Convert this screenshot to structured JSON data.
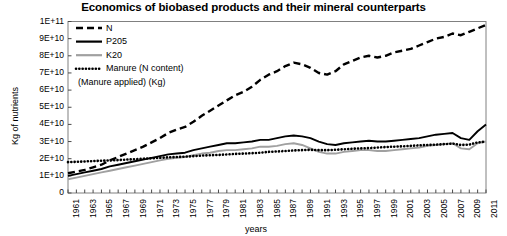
{
  "chart_data": {
    "type": "line",
    "title": "Economics of biobased products and their mineral counterparts",
    "xlabel": "years",
    "ylabel": "Kg of nutrients",
    "grid": false,
    "legend_position": "top-left",
    "xlim": [
      1961,
      2011
    ],
    "ylim": [
      0,
      100000000000
    ],
    "ytick_labels": [
      "1E+11",
      "9E+10",
      "8E+10",
      "7E+10",
      "6E+10",
      "5E+10",
      "4E+10",
      "3E+10",
      "2E+10",
      "1E+10",
      "0"
    ],
    "ytick_values": [
      100000000000,
      90000000000,
      80000000000,
      70000000000,
      60000000000,
      50000000000,
      40000000000,
      30000000000,
      20000000000,
      10000000000,
      0
    ],
    "xtick_labels": [
      "1961",
      "1963",
      "1965",
      "1967",
      "1969",
      "1971",
      "1973",
      "1975",
      "1977",
      "1979",
      "1981",
      "1983",
      "1985",
      "1987",
      "1989",
      "1991",
      "1993",
      "1995",
      "1997",
      "1999",
      "2001",
      "2003",
      "2005",
      "2007",
      "2009",
      "2011"
    ],
    "x": [
      1961,
      1962,
      1963,
      1964,
      1965,
      1966,
      1967,
      1968,
      1969,
      1970,
      1971,
      1972,
      1973,
      1974,
      1975,
      1976,
      1977,
      1978,
      1979,
      1980,
      1981,
      1982,
      1983,
      1984,
      1985,
      1986,
      1987,
      1988,
      1989,
      1990,
      1991,
      1992,
      1993,
      1994,
      1995,
      1996,
      1997,
      1998,
      1999,
      2000,
      2001,
      2002,
      2003,
      2004,
      2005,
      2006,
      2007,
      2008,
      2009,
      2010,
      2011
    ],
    "series": [
      {
        "name": "N",
        "style": "dashed",
        "color": "#000000",
        "values": [
          11500000000.0,
          12500000000.0,
          13500000000.0,
          15000000000.0,
          16500000000.0,
          19000000000.0,
          21000000000.0,
          23000000000.0,
          25000000000.0,
          27000000000.0,
          29500000000.0,
          32000000000.0,
          35000000000.0,
          37000000000.0,
          38500000000.0,
          41500000000.0,
          45000000000.0,
          48000000000.0,
          51000000000.0,
          54000000000.0,
          57000000000.0,
          59000000000.0,
          62000000000.0,
          66000000000.0,
          69000000000.0,
          71000000000.0,
          74000000000.0,
          76000000000.0,
          75000000000.0,
          73000000000.0,
          70000000000.0,
          69000000000.0,
          71000000000.0,
          75000000000.0,
          77000000000.0,
          79000000000.0,
          80000000000.0,
          79000000000.0,
          80000000000.0,
          82000000000.0,
          83000000000.0,
          84000000000.0,
          86000000000.0,
          88000000000.0,
          90000000000.0,
          91000000000.0,
          93000000000.0,
          92000000000.0,
          94000000000.0,
          96000000000.0,
          98000000000.0
        ]
      },
      {
        "name": "P205",
        "style": "solid",
        "color": "#000000",
        "values": [
          10000000000.0,
          11000000000.0,
          12000000000.0,
          13000000000.0,
          14000000000.0,
          15500000000.0,
          16500000000.0,
          17500000000.0,
          18500000000.0,
          19500000000.0,
          20500000000.0,
          21500000000.0,
          22500000000.0,
          23000000000.0,
          23500000000.0,
          25000000000.0,
          26000000000.0,
          27000000000.0,
          28000000000.0,
          29000000000.0,
          29000000000.0,
          29500000000.0,
          30000000000.0,
          31000000000.0,
          31000000000.0,
          32000000000.0,
          33000000000.0,
          33500000000.0,
          33000000000.0,
          32000000000.0,
          30000000000.0,
          28500000000.0,
          28000000000.0,
          29000000000.0,
          29500000000.0,
          30000000000.0,
          30500000000.0,
          30000000000.0,
          30000000000.0,
          30500000000.0,
          31000000000.0,
          31500000000.0,
          32000000000.0,
          33000000000.0,
          34000000000.0,
          34500000000.0,
          35000000000.0,
          32000000000.0,
          31000000000.0,
          36000000000.0,
          40000000000.0
        ]
      },
      {
        "name": "K20",
        "style": "solid",
        "color": "#a0a0a0",
        "values": [
          8000000000.0,
          9000000000.0,
          10000000000.0,
          11000000000.0,
          12000000000.0,
          13000000000.0,
          14000000000.0,
          15000000000.0,
          16000000000.0,
          17000000000.0,
          18000000000.0,
          19000000000.0,
          20000000000.0,
          20500000000.0,
          21000000000.0,
          22000000000.0,
          23000000000.0,
          23500000000.0,
          24500000000.0,
          25000000000.0,
          25000000000.0,
          25500000000.0,
          26000000000.0,
          27000000000.0,
          27000000000.0,
          27500000000.0,
          28500000000.0,
          29000000000.0,
          28000000000.0,
          26000000000.0,
          24000000000.0,
          23000000000.0,
          23000000000.0,
          24000000000.0,
          24500000000.0,
          25000000000.0,
          25000000000.0,
          24500000000.0,
          24500000000.0,
          25000000000.0,
          25500000000.0,
          26000000000.0,
          26500000000.0,
          27500000000.0,
          28000000000.0,
          28500000000.0,
          29000000000.0,
          26000000000.0,
          25500000000.0,
          29000000000.0,
          30000000000.0
        ]
      },
      {
        "name": "Manure (N content) (Manure applied) (Kg)",
        "style": "dotted",
        "color": "#000000",
        "values": [
          18000000000.0,
          18200000000.0,
          18400000000.0,
          18600000000.0,
          18800000000.0,
          19000000000.0,
          19200000000.0,
          19500000000.0,
          19700000000.0,
          20000000000.0,
          20200000000.0,
          20500000000.0,
          20800000000.0,
          21000000000.0,
          21200000000.0,
          21500000000.0,
          21800000000.0,
          22000000000.0,
          22200000000.0,
          22500000000.0,
          22800000000.0,
          23000000000.0,
          23200000000.0,
          23500000000.0,
          24000000000.0,
          24200000000.0,
          24500000000.0,
          24800000000.0,
          25000000000.0,
          25200000000.0,
          25000000000.0,
          25000000000.0,
          25200000000.0,
          25500000000.0,
          25800000000.0,
          26000000000.0,
          26200000000.0,
          26500000000.0,
          26800000000.0,
          27000000000.0,
          27200000000.0,
          27500000000.0,
          27800000000.0,
          28000000000.0,
          28200000000.0,
          28500000000.0,
          28800000000.0,
          28000000000.0,
          28200000000.0,
          29500000000.0,
          30000000000.0
        ]
      }
    ]
  },
  "legend": {
    "items": [
      {
        "label": "N",
        "style": "dashed",
        "color": "#000000"
      },
      {
        "label": "P205",
        "style": "solid",
        "color": "#000000"
      },
      {
        "label": "K20",
        "style": "solid",
        "color": "#a0a0a0"
      },
      {
        "label": "Manure (N content)",
        "style": "dotted",
        "color": "#000000"
      },
      {
        "label": "(Manure applied) (Kg)",
        "style": "none",
        "color": "#000000"
      }
    ]
  }
}
